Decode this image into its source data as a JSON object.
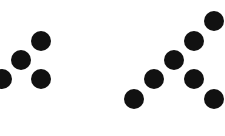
{
  "canvas": {
    "width": 225,
    "height": 136,
    "background": "#ffffff"
  },
  "dot_style": {
    "radius": 10,
    "color": "#111111"
  },
  "groups": [
    {
      "name": "left-pattern",
      "dots": [
        {
          "x": 41,
          "y": 41
        },
        {
          "x": 21,
          "y": 60
        },
        {
          "x": 2,
          "y": 79
        },
        {
          "x": 41,
          "y": 79
        }
      ]
    },
    {
      "name": "right-pattern",
      "dots": [
        {
          "x": 214,
          "y": 21
        },
        {
          "x": 194,
          "y": 41
        },
        {
          "x": 174,
          "y": 60
        },
        {
          "x": 154,
          "y": 79
        },
        {
          "x": 194,
          "y": 79
        },
        {
          "x": 134,
          "y": 99
        },
        {
          "x": 214,
          "y": 99
        }
      ]
    }
  ]
}
